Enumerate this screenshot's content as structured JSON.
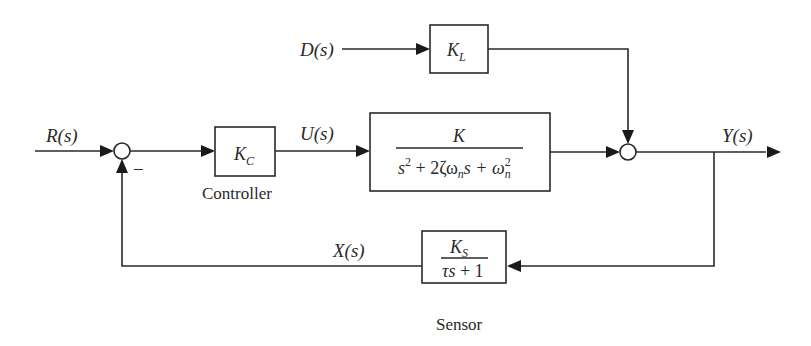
{
  "diagram": {
    "type": "feedback control block diagram",
    "signals": {
      "reference": "R(s)",
      "disturbance": "D(s)",
      "control": "U(s)",
      "output": "Y(s)",
      "feedback": "X(s)"
    },
    "blocks": {
      "controller": {
        "gain": "K",
        "gain_sub": "C",
        "caption": "Controller"
      },
      "load": {
        "gain": "K",
        "gain_sub": "L"
      },
      "plant": {
        "numerator": "K",
        "denominator": {
          "s": "s",
          "s_exp": "2",
          "plus1": " + 2ζω",
          "wn_sub": "n",
          "s2": "s + ω",
          "wn_exp": "2",
          "wn_sub2": "n"
        }
      },
      "sensor": {
        "numerator": "K",
        "numerator_sub": "S",
        "denominator_tau": "τs",
        "denominator_rest": " + 1",
        "caption": "Sensor"
      }
    },
    "summing_junctions": {
      "error": {
        "feedback_sign": "−"
      },
      "output": {}
    }
  }
}
